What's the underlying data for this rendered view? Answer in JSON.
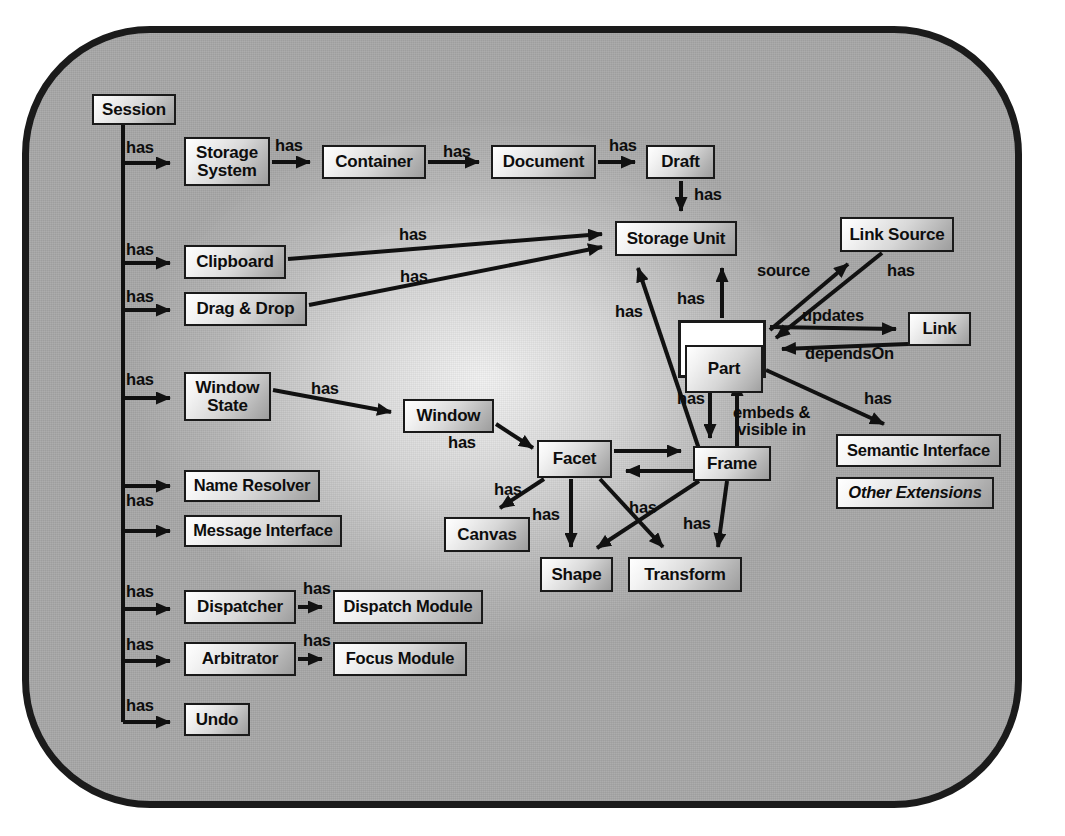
{
  "diagram": {
    "type": "entity-relationship",
    "frame": {
      "shape": "rounded-rectangle",
      "fill_color": "#a8a8a8",
      "border_color": "#1b1b1b"
    },
    "node_style": {
      "fill_gradient_from": "#ffffff",
      "fill_gradient_to": "#9d9d9d",
      "border_color": "#1a1a1a",
      "text_color": "#0d0d0d"
    },
    "nodes": [
      {
        "id": "session",
        "label": "Session",
        "x": 92,
        "y": 94,
        "w": 84,
        "h": 31,
        "style": "plain"
      },
      {
        "id": "storage_system",
        "label": "Storage\nSystem",
        "x": 184,
        "y": 137,
        "w": 86,
        "h": 49,
        "style": "plain"
      },
      {
        "id": "container",
        "label": "Container",
        "x": 322,
        "y": 145,
        "w": 104,
        "h": 34,
        "style": "plain"
      },
      {
        "id": "document",
        "label": "Document",
        "x": 491,
        "y": 145,
        "w": 105,
        "h": 34,
        "style": "plain"
      },
      {
        "id": "draft",
        "label": "Draft",
        "x": 646,
        "y": 145,
        "w": 69,
        "h": 34,
        "style": "plain"
      },
      {
        "id": "storage_unit",
        "label": "Storage Unit",
        "x": 615,
        "y": 221,
        "w": 122,
        "h": 35,
        "style": "plain"
      },
      {
        "id": "link_source",
        "label": "Link Source",
        "x": 840,
        "y": 217,
        "w": 114,
        "h": 35,
        "style": "plain"
      },
      {
        "id": "link",
        "label": "Link",
        "x": 908,
        "y": 312,
        "w": 63,
        "h": 34,
        "style": "plain"
      },
      {
        "id": "part",
        "label": "Part",
        "x": 678,
        "y": 320,
        "w": 88,
        "h": 58,
        "style": "double"
      },
      {
        "id": "clipboard",
        "label": "Clipboard",
        "x": 184,
        "y": 245,
        "w": 102,
        "h": 34,
        "style": "plain"
      },
      {
        "id": "drag_drop",
        "label": "Drag & Drop",
        "x": 184,
        "y": 292,
        "w": 123,
        "h": 34,
        "style": "plain"
      },
      {
        "id": "window_state",
        "label": "Window\nState",
        "x": 184,
        "y": 372,
        "w": 87,
        "h": 49,
        "style": "plain"
      },
      {
        "id": "window",
        "label": "Window",
        "x": 403,
        "y": 399,
        "w": 91,
        "h": 34,
        "style": "plain"
      },
      {
        "id": "facet",
        "label": "Facet",
        "x": 537,
        "y": 440,
        "w": 75,
        "h": 38,
        "style": "plain"
      },
      {
        "id": "frame",
        "label": "Frame",
        "x": 693,
        "y": 446,
        "w": 78,
        "h": 35,
        "style": "plain"
      },
      {
        "id": "semantic_interface",
        "label": "Semantic Interface",
        "x": 836,
        "y": 434,
        "w": 165,
        "h": 33,
        "style": "plain"
      },
      {
        "id": "other_extensions",
        "label": "Other Extensions",
        "x": 836,
        "y": 477,
        "w": 158,
        "h": 32,
        "style": "italic"
      },
      {
        "id": "canvas",
        "label": "Canvas",
        "x": 444,
        "y": 517,
        "w": 86,
        "h": 35,
        "style": "plain"
      },
      {
        "id": "shape",
        "label": "Shape",
        "x": 540,
        "y": 557,
        "w": 73,
        "h": 35,
        "style": "plain"
      },
      {
        "id": "transform",
        "label": "Transform",
        "x": 628,
        "y": 557,
        "w": 114,
        "h": 35,
        "style": "plain"
      },
      {
        "id": "name_resolver",
        "label": "Name Resolver",
        "x": 184,
        "y": 470,
        "w": 136,
        "h": 32,
        "style": "plain"
      },
      {
        "id": "message_interface",
        "label": "Message Interface",
        "x": 184,
        "y": 515,
        "w": 158,
        "h": 32,
        "style": "plain"
      },
      {
        "id": "dispatcher",
        "label": "Dispatcher",
        "x": 184,
        "y": 590,
        "w": 112,
        "h": 34,
        "style": "plain"
      },
      {
        "id": "dispatch_module",
        "label": "Dispatch Module",
        "x": 333,
        "y": 590,
        "w": 150,
        "h": 34,
        "style": "plain"
      },
      {
        "id": "arbitrator",
        "label": "Arbitrator",
        "x": 184,
        "y": 642,
        "w": 112,
        "h": 34,
        "style": "plain"
      },
      {
        "id": "focus_module",
        "label": "Focus Module",
        "x": 333,
        "y": 642,
        "w": 134,
        "h": 34,
        "style": "plain"
      },
      {
        "id": "undo",
        "label": "Undo",
        "x": 184,
        "y": 703,
        "w": 66,
        "h": 33,
        "style": "plain"
      }
    ],
    "edges": [
      {
        "from": "session",
        "to": "storage_system",
        "label": "has"
      },
      {
        "from": "storage_system",
        "to": "container",
        "label": "has"
      },
      {
        "from": "container",
        "to": "document",
        "label": "has"
      },
      {
        "from": "document",
        "to": "draft",
        "label": "has"
      },
      {
        "from": "draft",
        "to": "storage_unit",
        "label": "has"
      },
      {
        "from": "session",
        "to": "clipboard",
        "label": "has"
      },
      {
        "from": "clipboard",
        "to": "storage_unit",
        "label": "has"
      },
      {
        "from": "session",
        "to": "drag_drop",
        "label": "has"
      },
      {
        "from": "drag_drop",
        "to": "storage_unit",
        "label": "has"
      },
      {
        "from": "part",
        "to": "storage_unit",
        "label": "has"
      },
      {
        "from": "frame",
        "to": "storage_unit",
        "label": "has"
      },
      {
        "from": "part",
        "to": "link_source",
        "label": "source"
      },
      {
        "from": "link_source",
        "to": "part",
        "label": "has"
      },
      {
        "from": "part",
        "to": "link",
        "label": "updates"
      },
      {
        "from": "link",
        "to": "part",
        "label": "dependsOn"
      },
      {
        "from": "part",
        "to": "semantic_interface",
        "label": "has"
      },
      {
        "from": "part",
        "to": "frame",
        "label": "has"
      },
      {
        "from": "frame",
        "to": "part",
        "label": "embeds &\nvisible in"
      },
      {
        "from": "session",
        "to": "window_state",
        "label": "has"
      },
      {
        "from": "window_state",
        "to": "window",
        "label": "has"
      },
      {
        "from": "window",
        "to": "facet",
        "label": "has"
      },
      {
        "from": "facet",
        "to": "frame",
        "label": ""
      },
      {
        "from": "frame",
        "to": "facet",
        "label": ""
      },
      {
        "from": "facet",
        "to": "canvas",
        "label": "has"
      },
      {
        "from": "facet",
        "to": "shape",
        "label": "has"
      },
      {
        "from": "facet",
        "to": "transform",
        "label": "has"
      },
      {
        "from": "frame",
        "to": "shape",
        "label": "has"
      },
      {
        "from": "frame",
        "to": "transform",
        "label": "has"
      },
      {
        "from": "session",
        "to": "name_resolver",
        "label": ""
      },
      {
        "from": "session",
        "to": "message_interface",
        "label": "has"
      },
      {
        "from": "session",
        "to": "dispatcher",
        "label": "has"
      },
      {
        "from": "dispatcher",
        "to": "dispatch_module",
        "label": "has"
      },
      {
        "from": "session",
        "to": "arbitrator",
        "label": "has"
      },
      {
        "from": "arbitrator",
        "to": "focus_module",
        "label": "has"
      },
      {
        "from": "session",
        "to": "undo",
        "label": "has"
      }
    ],
    "edge_labels": [
      {
        "id": "l-session-storage",
        "text": "has",
        "x": 126,
        "y": 139
      },
      {
        "id": "l-storsys-container",
        "text": "has",
        "x": 275,
        "y": 137
      },
      {
        "id": "l-container-doc",
        "text": "has",
        "x": 443,
        "y": 143
      },
      {
        "id": "l-doc-draft",
        "text": "has",
        "x": 609,
        "y": 137
      },
      {
        "id": "l-draft-su",
        "text": "has",
        "x": 694,
        "y": 186
      },
      {
        "id": "l-session-clip",
        "text": "has",
        "x": 126,
        "y": 241
      },
      {
        "id": "l-clip-su",
        "text": "has",
        "x": 399,
        "y": 226
      },
      {
        "id": "l-session-dd",
        "text": "has",
        "x": 126,
        "y": 288
      },
      {
        "id": "l-dd-su",
        "text": "has",
        "x": 400,
        "y": 268
      },
      {
        "id": "l-frame-su",
        "text": "has",
        "x": 615,
        "y": 303
      },
      {
        "id": "l-part-su",
        "text": "has",
        "x": 677,
        "y": 290
      },
      {
        "id": "l-part-linksource",
        "text": "source",
        "x": 757,
        "y": 262
      },
      {
        "id": "l-linksource-part",
        "text": "has",
        "x": 887,
        "y": 262
      },
      {
        "id": "l-part-link",
        "text": "updates",
        "x": 802,
        "y": 307
      },
      {
        "id": "l-link-part",
        "text": "dependsOn",
        "x": 805,
        "y": 345
      },
      {
        "id": "l-part-semantic",
        "text": "has",
        "x": 864,
        "y": 390
      },
      {
        "id": "l-part-frame",
        "text": "has",
        "x": 677,
        "y": 390
      },
      {
        "id": "l-frame-part",
        "text": "embeds &\nvisible in",
        "x": 733,
        "y": 404
      },
      {
        "id": "l-session-ws",
        "text": "has",
        "x": 126,
        "y": 371
      },
      {
        "id": "l-ws-window",
        "text": "has",
        "x": 311,
        "y": 380
      },
      {
        "id": "l-window-facet",
        "text": "has",
        "x": 448,
        "y": 434
      },
      {
        "id": "l-facet-canvas",
        "text": "has",
        "x": 494,
        "y": 481
      },
      {
        "id": "l-facet-shape",
        "text": "has",
        "x": 532,
        "y": 506
      },
      {
        "id": "l-facet-transform",
        "text": "has",
        "x": 629,
        "y": 499
      },
      {
        "id": "l-frame-transform",
        "text": "has",
        "x": 683,
        "y": 515
      },
      {
        "id": "l-session-msg",
        "text": "has",
        "x": 126,
        "y": 492
      },
      {
        "id": "l-session-disp",
        "text": "has",
        "x": 126,
        "y": 583
      },
      {
        "id": "l-disp-dmod",
        "text": "has",
        "x": 303,
        "y": 580
      },
      {
        "id": "l-session-arb",
        "text": "has",
        "x": 126,
        "y": 636
      },
      {
        "id": "l-arb-fmod",
        "text": "has",
        "x": 303,
        "y": 632
      },
      {
        "id": "l-session-undo",
        "text": "has",
        "x": 126,
        "y": 697
      }
    ]
  }
}
